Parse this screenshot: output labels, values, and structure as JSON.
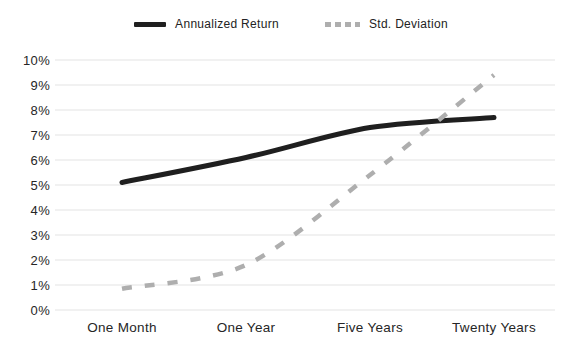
{
  "legend": {
    "annualized_return_label": "Annualized Return",
    "std_deviation_label": "Std. Deviation"
  },
  "chart_data": {
    "type": "line",
    "categories": [
      "One Month",
      "One Year",
      "Five Years",
      "Twenty Years"
    ],
    "series": [
      {
        "name": "Annualized Return",
        "values": [
          5.1,
          6.1,
          7.3,
          7.7
        ],
        "color": "#1f1f1f",
        "line_style": "solid",
        "line_width": 5
      },
      {
        "name": "Std. Deviation",
        "values": [
          0.85,
          1.8,
          5.4,
          9.4
        ],
        "color": "#aeaeae",
        "line_style": "dashed",
        "line_width": 4.5
      }
    ],
    "title": "",
    "xlabel": "",
    "ylabel": "",
    "ylim": [
      0,
      10
    ],
    "ytick_step": 1,
    "ytick_labels": [
      "0%",
      "1%",
      "2%",
      "3%",
      "4%",
      "5%",
      "6%",
      "7%",
      "8%",
      "9%",
      "10%"
    ],
    "grid": true,
    "grid_color": "#e3e3e3",
    "text_color": "#262626",
    "legend_position": "top"
  }
}
